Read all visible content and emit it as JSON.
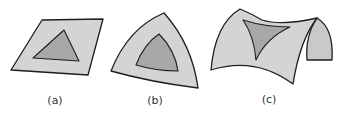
{
  "figure": {
    "colors": {
      "surface": "#d4d4d4",
      "surface_back": "#c9c9c9",
      "triangle": "#a8a8a8",
      "outline": "#1e1e1e",
      "background": "#ffffff"
    },
    "panels": [
      {
        "id": "a",
        "label": "(a)",
        "surface": "flat plane",
        "triangle": "planar triangle"
      },
      {
        "id": "b",
        "label": "(b)",
        "surface": "sphere-like positively curved surface",
        "triangle": "bulging spherical triangle"
      },
      {
        "id": "c",
        "label": "(c)",
        "surface": "saddle-shaped negatively curved surface",
        "triangle": "concave hyperbolic triangle"
      }
    ]
  }
}
